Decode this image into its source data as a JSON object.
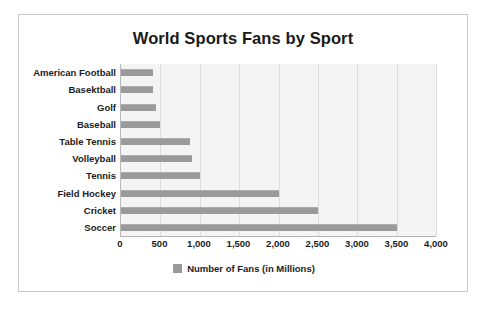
{
  "card": {
    "border_color": "#c9c9c9",
    "background": "#ffffff"
  },
  "chart_data": {
    "type": "bar",
    "orientation": "horizontal",
    "title": "World Sports Fans by Sport",
    "xlabel": "",
    "ylabel": "",
    "xlim": [
      0,
      4000
    ],
    "grid": true,
    "legend_position": "bottom",
    "bar_color": "#9a9a9a",
    "plot_background": "#f4f4f4",
    "categories": [
      "American Football",
      "Basektball",
      "Golf",
      "Baseball",
      "Table Tennis",
      "Volleyball",
      "Tennis",
      "Field Hockey",
      "Cricket",
      "Soccer"
    ],
    "values": [
      400,
      400,
      450,
      500,
      875,
      900,
      1000,
      2000,
      2500,
      3500
    ],
    "series": [
      {
        "name": "Number of Fans (in Millions)",
        "values": [
          400,
          400,
          450,
          500,
          875,
          900,
          1000,
          2000,
          2500,
          3500
        ]
      }
    ],
    "xticks": [
      0,
      500,
      1000,
      1500,
      2000,
      2500,
      3000,
      3500,
      4000
    ],
    "xticklabels": [
      "0",
      "500",
      "1,000",
      "1,500",
      "2,000",
      "2,500",
      "3,000",
      "3,500",
      "4,000"
    ],
    "legend": [
      {
        "label": "Number of Fans (in Millions)",
        "color": "#9a9a9a"
      }
    ]
  }
}
